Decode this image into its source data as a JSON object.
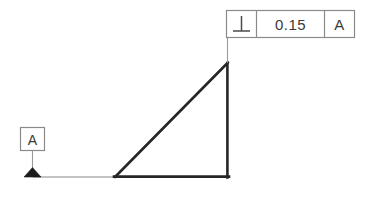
{
  "drawing": {
    "title": "Perpendicularity Geometric Tolerance Callout",
    "background_color": "#ffffff",
    "line_color": "#262626",
    "thin_line_color": "#8a8a8a",
    "frame_border_color": "#8a8a8a",
    "text_color": "#3a3a3a"
  },
  "feature_control_frame": {
    "name": "feature-control-frame",
    "cells": [
      {
        "type": "symbol",
        "icon": "perpendicularity-icon",
        "glyph": "⊥",
        "label": "Perpendicularity"
      },
      {
        "type": "tolerance",
        "value": "0.15"
      },
      {
        "type": "datum_reference",
        "value": "A"
      }
    ],
    "geometry": {
      "x": 226,
      "y": 10,
      "width": 129,
      "height": 28,
      "divider_1_x": 256,
      "divider_2_x": 324
    }
  },
  "datum_feature": {
    "name": "datum-feature-symbol",
    "label": "A",
    "box": {
      "x": 20,
      "y": 127,
      "width": 25,
      "height": 24
    },
    "leader": {
      "x": 33,
      "y_start": 151,
      "y_end": 169
    },
    "triangle": {
      "cx": 33,
      "base_y": 177,
      "half_width": 9,
      "height": 9,
      "filled": true
    }
  },
  "part_outline": {
    "name": "part-outline-triangle",
    "vertices": {
      "bottom_left": {
        "x": 115,
        "y": 177
      },
      "bottom_right": {
        "x": 228,
        "y": 177
      },
      "apex": {
        "x": 228,
        "y": 63
      }
    },
    "line_width": 2.6
  },
  "extension_line": {
    "name": "datum-extension-line",
    "x_start": 33,
    "x_end": 114,
    "y": 177
  },
  "leader_line": {
    "name": "fcf-leader-line",
    "x": 228,
    "y_start": 38,
    "y_end": 63
  }
}
